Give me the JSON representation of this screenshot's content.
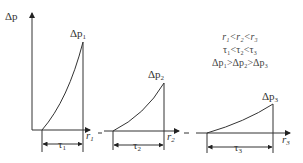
{
  "diagram": {
    "y_axis_label": "Δp",
    "panels": [
      {
        "peak_label": "Δp",
        "peak_sub": "1",
        "x_label": "r",
        "x_sub": "1",
        "dim_label": "τ",
        "dim_sub": "1"
      },
      {
        "peak_label": "Δp",
        "peak_sub": "2",
        "x_label": "r",
        "x_sub": "2",
        "dim_label": "τ",
        "dim_sub": "2"
      },
      {
        "peak_label": "Δp",
        "peak_sub": "3",
        "x_label": "r",
        "x_sub": "3",
        "dim_label": "τ",
        "dim_sub": "3"
      }
    ],
    "relations": [
      "r₁<r₂<r₃",
      "τ₁<τ₂<τ₃",
      "Δp₁>Δp₂>Δp₃"
    ],
    "line_color": "#333333"
  }
}
